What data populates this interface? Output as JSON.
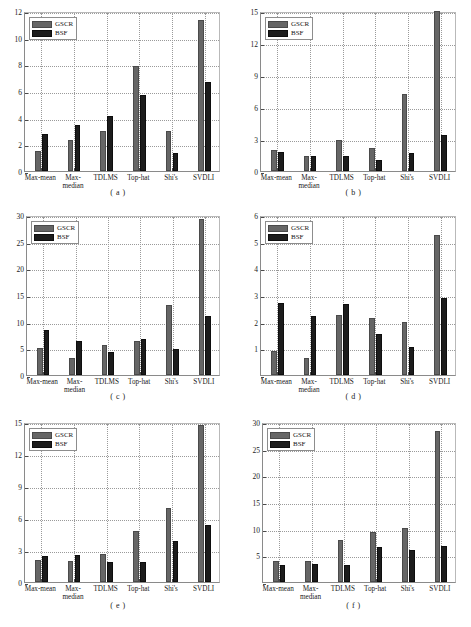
{
  "figure": {
    "width": 471,
    "height": 627,
    "background": "#ffffff",
    "series_colors": {
      "GSCR": "#666666",
      "BSF": "#1c1c1c"
    }
  },
  "legend": {
    "entries": [
      {
        "label": "GSCR",
        "color": "#666666",
        "swatch": "gscr-swatch"
      },
      {
        "label": "BSF",
        "color": "#1c1c1c",
        "swatch": "bsf-swatch"
      }
    ]
  },
  "categories": [
    "Max-mean",
    "Max-\nmedian",
    "TDLMS",
    "Top-hat",
    "Shi's",
    "SVDLI"
  ],
  "captions": [
    "( a )",
    "( b )",
    "( c )",
    "( d )",
    "( e )",
    "( f )"
  ],
  "chart_data": [
    {
      "type": "bar",
      "title": "( a )",
      "panel": "a",
      "categories": [
        "Max-mean",
        "Max-median",
        "TDLMS",
        "Top-hat",
        "Shi's",
        "SVDLI"
      ],
      "series": [
        {
          "name": "GSCR",
          "values": [
            1.5,
            2.3,
            3.0,
            7.9,
            3.0,
            11.3
          ]
        },
        {
          "name": "BSF",
          "values": [
            2.8,
            3.45,
            4.15,
            5.7,
            1.35,
            6.65
          ]
        }
      ],
      "xlabel": "",
      "ylabel": "",
      "ylim": [
        0,
        12
      ],
      "yticks": [
        0,
        2,
        4,
        6,
        8,
        10,
        12
      ],
      "ytick_labels": [
        "0",
        "2",
        "4",
        "6",
        "8",
        "10",
        "12"
      ],
      "grid": true,
      "legend_position": "top-left"
    },
    {
      "type": "bar",
      "title": "( b )",
      "panel": "b",
      "categories": [
        "Max-mean",
        "Max-median",
        "TDLMS",
        "Top-hat",
        "Shi's",
        "SVDLI"
      ],
      "series": [
        {
          "name": "GSCR",
          "values": [
            1.95,
            1.45,
            2.9,
            2.2,
            7.2,
            15.0
          ]
        },
        {
          "name": "BSF",
          "values": [
            1.8,
            1.45,
            1.4,
            1.0,
            1.7,
            3.4
          ]
        }
      ],
      "xlabel": "",
      "ylabel": "",
      "ylim": [
        0,
        15
      ],
      "yticks": [
        0,
        3,
        6,
        9,
        12,
        15
      ],
      "ytick_labels": [
        "0",
        "3",
        "6",
        "9",
        "12",
        "15"
      ],
      "grid": true,
      "legend_position": "top-left"
    },
    {
      "type": "bar",
      "title": "( c )",
      "panel": "c",
      "categories": [
        "Max-mean",
        "Max-median",
        "TDLMS",
        "Top-hat",
        "Shi's",
        "SVDLI"
      ],
      "series": [
        {
          "name": "GSCR",
          "values": [
            5.0,
            3.2,
            5.6,
            6.3,
            13.1,
            29.3
          ]
        },
        {
          "name": "BSF",
          "values": [
            8.4,
            6.3,
            4.4,
            6.8,
            4.9,
            11.1
          ]
        }
      ],
      "xlabel": "",
      "ylabel": "",
      "ylim": [
        0,
        30
      ],
      "yticks": [
        0,
        5,
        10,
        15,
        20,
        25,
        30
      ],
      "ytick_labels": [
        "0",
        "5",
        "10",
        "15",
        "20",
        "25",
        "30"
      ],
      "grid": true,
      "legend_position": "top-left"
    },
    {
      "type": "bar",
      "title": "( d )",
      "panel": "d",
      "categories": [
        "Max-mean",
        "Max-median",
        "TDLMS",
        "Top-hat",
        "Shi's",
        "SVDLI"
      ],
      "series": [
        {
          "name": "GSCR",
          "values": [
            0.9,
            0.65,
            2.25,
            2.15,
            2.0,
            5.25
          ]
        },
        {
          "name": "BSF",
          "values": [
            2.7,
            2.2,
            2.65,
            1.55,
            1.05,
            2.9
          ]
        }
      ],
      "xlabel": "",
      "ylabel": "",
      "ylim": [
        0,
        6
      ],
      "yticks": [
        0,
        1,
        2,
        3,
        4,
        5,
        6
      ],
      "ytick_labels": [
        "",
        "1",
        "2",
        "3",
        "4",
        "5",
        "6"
      ],
      "grid": true,
      "legend_position": "top-left"
    },
    {
      "type": "bar",
      "title": "( e )",
      "panel": "e",
      "categories": [
        "Max-mean",
        "Max-median",
        "TDLMS",
        "Top-hat",
        "Shi's",
        "SVDLI"
      ],
      "series": [
        {
          "name": "GSCR",
          "values": [
            2.1,
            2.0,
            2.6,
            4.8,
            6.9,
            14.7
          ]
        },
        {
          "name": "BSF",
          "values": [
            2.4,
            2.55,
            1.9,
            1.85,
            3.85,
            5.3
          ]
        }
      ],
      "xlabel": "",
      "ylabel": "",
      "ylim": [
        0,
        15
      ],
      "yticks": [
        0,
        3,
        6,
        9,
        12,
        15
      ],
      "ytick_labels": [
        "0",
        "3",
        "6",
        "9",
        "12",
        "15"
      ],
      "grid": true,
      "legend_position": "top-left"
    },
    {
      "type": "bar",
      "title": "( f )",
      "panel": "f",
      "categories": [
        "Max-mean",
        "Max-median",
        "TDLMS",
        "Top-hat",
        "Shi's",
        "SVDLI"
      ],
      "series": [
        {
          "name": "GSCR",
          "values": [
            4.0,
            4.0,
            7.8,
            9.3,
            10.1,
            28.3
          ]
        },
        {
          "name": "BSF",
          "values": [
            3.2,
            3.3,
            3.2,
            6.6,
            6.0,
            6.8
          ]
        }
      ],
      "xlabel": "",
      "ylabel": "",
      "ylim": [
        0,
        30
      ],
      "yticks": [
        0,
        5,
        10,
        15,
        20,
        25,
        30
      ],
      "ytick_labels": [
        "",
        "5",
        "10",
        "15",
        "20",
        "25",
        "30"
      ],
      "grid": true,
      "legend_position": "top-left"
    }
  ]
}
